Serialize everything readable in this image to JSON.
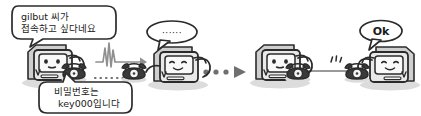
{
  "scene": {
    "width": 421,
    "height": 116,
    "background": "#ffffff",
    "title": "Network handshake illustration with four computer characters",
    "ink_color": "#2b2b2b",
    "body_fill": "#e9e9e9",
    "screen_fill": "#f7f7f7",
    "shadow_color": "#d6d6d6",
    "link_color": "#8a8a8a"
  },
  "bubbles": [
    {
      "id": "request-bubble",
      "name": "speech-bubble-request",
      "lines": [
        "gilbut 씨가",
        "접속하고 싶다네요"
      ],
      "tail": "down-left"
    },
    {
      "id": "dots-bubble",
      "name": "speech-bubble-dots",
      "lines": [
        "······"
      ],
      "tail": "down-left"
    },
    {
      "id": "password-bubble",
      "name": "speech-bubble-password",
      "lines": [
        "비밀번호는",
        "key000입니다"
      ],
      "tail": "up-left"
    },
    {
      "id": "ok-bubble",
      "name": "speech-bubble-ok",
      "lines": [
        "Ok"
      ],
      "tail": "down-left"
    }
  ],
  "computers": [
    {
      "id": "computer-1",
      "name": "computer-character-1",
      "facing": "right",
      "phone_side": "right",
      "expression": "neutral"
    },
    {
      "id": "computer-2",
      "name": "computer-character-2",
      "facing": "right",
      "phone_side": "left",
      "expression": "smile"
    },
    {
      "id": "computer-3",
      "name": "computer-character-3",
      "facing": "right",
      "phone_side": "right",
      "expression": "neutral"
    },
    {
      "id": "computer-4",
      "name": "computer-character-4",
      "facing": "left",
      "phone_side": "left",
      "expression": "smile"
    }
  ],
  "connectors": [
    {
      "id": "waveform-arrow",
      "name": "signal-waveform-arrow",
      "type": "waveform-with-arrow",
      "direction": "right"
    },
    {
      "id": "dotted-line-1",
      "name": "dotted-connection-line",
      "type": "dotted-line",
      "direction": "right"
    },
    {
      "id": "dots-arrow",
      "name": "dotted-arrow",
      "type": "dots-with-arrow",
      "direction": "right"
    },
    {
      "id": "solid-link",
      "name": "connection-line",
      "type": "solid-line",
      "direction": "right"
    }
  ],
  "marks": [
    {
      "id": "sparkle-mark",
      "name": "sparkle-mark",
      "glyph": "ʻʻʻ"
    }
  ]
}
